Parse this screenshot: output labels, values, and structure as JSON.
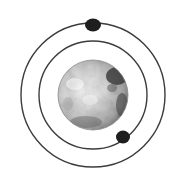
{
  "diagram": {
    "background": "#ffffff",
    "center": {
      "x": 93,
      "y": 95
    },
    "planet": {
      "radius": 35,
      "base_color": "#c8c8c8",
      "light_color": "#f0f0f0",
      "shadow_color": "#3a3a3a"
    },
    "orbits": [
      {
        "name": "inner-orbit",
        "radius": 54,
        "stroke": "#3c3c3c",
        "width": 1.4
      },
      {
        "name": "outer-orbit",
        "radius": 72,
        "stroke": "#3c3c3c",
        "width": 1.4
      }
    ],
    "moons": [
      {
        "name": "outer-moon",
        "x": 93,
        "y": 25,
        "rx": 8,
        "ry": 6.5,
        "color": "#1e1e1e"
      },
      {
        "name": "inner-moon",
        "x": 123,
        "y": 137,
        "rx": 7,
        "ry": 6.5,
        "color": "#1e1e1e"
      }
    ]
  }
}
